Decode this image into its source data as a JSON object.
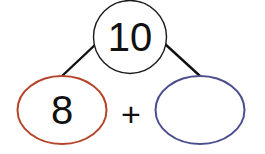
{
  "diagram": {
    "type": "number-bond",
    "whole": {
      "value": "10",
      "stroke": "#1a1a1a"
    },
    "parts": [
      {
        "value": "8",
        "stroke": "#b5442a"
      },
      {
        "value": "",
        "stroke": "#4a4f8c"
      }
    ],
    "operator": "+"
  }
}
